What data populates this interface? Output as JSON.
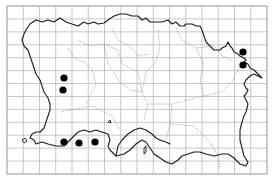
{
  "map": {
    "subject": "Jersey distribution map",
    "grid": {
      "x0": 7,
      "y0": 6,
      "x1": 267,
      "y1": 174,
      "columns": 16,
      "rows": 13,
      "line_color": "#b8b8b8"
    },
    "colors": {
      "background": "#ffffff",
      "coastline": "#1a1a1a",
      "parish_boundary": "#8a8a8a",
      "record_dot": "#000000"
    },
    "records": [
      {
        "x": 64,
        "y": 78,
        "r": 3.6
      },
      {
        "x": 63,
        "y": 90,
        "r": 3.6
      },
      {
        "x": 64,
        "y": 142,
        "r": 3.6
      },
      {
        "x": 79,
        "y": 143,
        "r": 3.6
      },
      {
        "x": 95,
        "y": 142,
        "r": 3.6
      },
      {
        "x": 243,
        "y": 52,
        "r": 3.6
      },
      {
        "x": 243,
        "y": 65,
        "r": 3.6
      }
    ]
  }
}
